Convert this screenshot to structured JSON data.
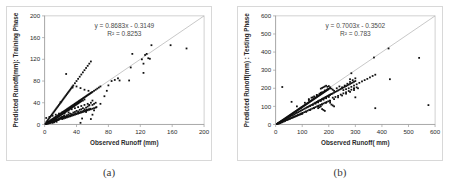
{
  "figure": {
    "background_color": "#ffffff",
    "panel_border_color": "#d8d8d8",
    "point_color": "#111111",
    "line_color": "#b0b0b0",
    "axis_color": "#9a9a9a"
  },
  "captions": {
    "a": "(a)",
    "b": "(b)"
  },
  "chart_data": [
    {
      "id": "a",
      "type": "scatter",
      "title": "",
      "xlabel": "Observed Runoff (mm)",
      "ylabel": "Predicted Runoff(mm): Training Phase",
      "xlim": [
        0,
        200
      ],
      "ylim": [
        0,
        200
      ],
      "xticks": [
        0,
        40,
        80,
        120,
        160,
        200
      ],
      "yticks": [
        0,
        40,
        80,
        120,
        160,
        200
      ],
      "grid": false,
      "legend": "none",
      "annotations": {
        "equation": "y = 0.8683x - 0.3149",
        "r2": "R² = 0.8253"
      },
      "fit": {
        "slope": 0.8683,
        "intercept": -0.3149,
        "r2": 0.8253
      },
      "reference_line": {
        "type": "1:1",
        "from": [
          0,
          0
        ],
        "to": [
          200,
          200
        ]
      },
      "x": [
        1,
        2,
        2,
        3,
        3,
        4,
        4,
        4,
        5,
        5,
        5,
        6,
        6,
        6,
        7,
        7,
        7,
        8,
        8,
        8,
        9,
        9,
        9,
        10,
        10,
        10,
        10,
        11,
        11,
        11,
        12,
        12,
        12,
        12,
        13,
        13,
        13,
        14,
        14,
        14,
        15,
        15,
        15,
        15,
        16,
        16,
        16,
        17,
        17,
        17,
        18,
        18,
        18,
        19,
        19,
        19,
        20,
        20,
        20,
        21,
        21,
        21,
        22,
        22,
        22,
        23,
        23,
        24,
        24,
        24,
        25,
        25,
        25,
        26,
        26,
        27,
        27,
        28,
        28,
        29,
        29,
        30,
        30,
        31,
        31,
        32,
        32,
        33,
        33,
        34,
        34,
        35,
        35,
        36,
        36,
        37,
        37,
        38,
        38,
        39,
        39,
        40,
        40,
        41,
        41,
        42,
        42,
        43,
        43,
        44,
        44,
        45,
        45,
        46,
        46,
        47,
        48,
        48,
        49,
        50,
        50,
        51,
        52,
        53,
        54,
        55,
        56,
        57,
        58,
        59,
        60,
        62,
        64,
        66,
        68,
        70,
        2,
        3,
        4,
        5,
        6,
        7,
        8,
        9,
        10,
        11,
        12,
        13,
        14,
        15,
        16,
        17,
        18,
        19,
        20,
        21,
        22,
        23,
        24,
        25,
        26,
        27,
        28,
        29,
        30,
        31,
        32,
        33,
        34,
        35,
        36,
        38,
        40,
        42,
        44,
        46,
        48,
        50,
        52,
        54,
        56,
        58,
        22,
        24,
        26,
        28,
        30,
        32,
        34,
        36,
        38,
        40,
        42,
        44,
        46,
        48,
        50,
        52,
        54,
        56,
        58,
        60,
        62,
        64,
        20,
        25,
        30,
        35,
        40,
        45,
        50,
        55,
        60,
        65,
        70,
        75,
        78,
        80,
        84,
        88,
        92,
        94,
        106,
        108,
        110,
        122,
        124,
        124,
        126,
        128,
        130,
        132,
        134,
        158,
        178,
        3,
        5,
        7,
        9,
        11,
        13,
        15,
        17,
        19,
        21,
        23,
        25,
        27,
        29,
        31,
        33,
        35,
        37,
        39,
        41,
        43,
        45,
        47,
        49,
        51,
        53,
        55,
        57,
        27,
        45,
        47,
        52,
        56,
        58,
        60,
        62,
        2,
        10,
        18,
        26,
        34,
        42,
        50,
        4,
        12,
        20,
        28,
        36,
        44,
        52,
        60,
        6,
        14,
        22,
        30,
        38,
        46,
        54,
        62,
        8,
        16,
        24,
        32,
        40,
        48,
        56,
        64,
        2,
        6,
        10,
        14,
        18,
        22,
        26,
        30,
        34,
        38,
        42,
        46,
        50,
        54,
        58
      ],
      "y": [
        1,
        2,
        1,
        3,
        2,
        4,
        3,
        2,
        5,
        4,
        2,
        6,
        4,
        3,
        7,
        5,
        3,
        8,
        6,
        4,
        9,
        7,
        4,
        10,
        8,
        6,
        3,
        11,
        9,
        5,
        12,
        10,
        7,
        4,
        13,
        10,
        6,
        14,
        11,
        7,
        15,
        12,
        9,
        5,
        16,
        13,
        8,
        17,
        14,
        9,
        18,
        15,
        10,
        19,
        16,
        11,
        20,
        17,
        12,
        21,
        18,
        13,
        22,
        19,
        14,
        23,
        20,
        24,
        21,
        15,
        25,
        22,
        16,
        26,
        23,
        27,
        24,
        28,
        25,
        29,
        26,
        30,
        27,
        31,
        28,
        32,
        29,
        33,
        30,
        34,
        31,
        35,
        32,
        36,
        33,
        37,
        34,
        38,
        35,
        39,
        36,
        40,
        37,
        41,
        38,
        42,
        39,
        43,
        40,
        44,
        41,
        45,
        42,
        46,
        43,
        47,
        48,
        44,
        49,
        50,
        46,
        51,
        52,
        53,
        54,
        55,
        56,
        57,
        58,
        59,
        60,
        62,
        64,
        66,
        68,
        70,
        4,
        6,
        8,
        10,
        12,
        14,
        16,
        18,
        20,
        22,
        24,
        26,
        28,
        30,
        32,
        34,
        36,
        38,
        40,
        42,
        44,
        46,
        48,
        50,
        52,
        54,
        56,
        58,
        60,
        62,
        64,
        66,
        68,
        70,
        72,
        76,
        80,
        84,
        88,
        92,
        96,
        100,
        104,
        108,
        112,
        116,
        10,
        11,
        12,
        13,
        14,
        15,
        16,
        17,
        18,
        19,
        20,
        21,
        22,
        23,
        24,
        25,
        26,
        27,
        28,
        29,
        30,
        31,
        41,
        20,
        22,
        68,
        70,
        67,
        64,
        62,
        44,
        32,
        38,
        52,
        62,
        72,
        80,
        82,
        85,
        81,
        81,
        105,
        130,
        120,
        95,
        112,
        128,
        130,
        122,
        121,
        146,
        146,
        140,
        2,
        3,
        4,
        5,
        6,
        7,
        8,
        9,
        10,
        11,
        12,
        13,
        14,
        15,
        16,
        17,
        18,
        19,
        20,
        21,
        22,
        23,
        24,
        25,
        26,
        27,
        28,
        29,
        93,
        3,
        11,
        23,
        36,
        10,
        18,
        26,
        1,
        5,
        9,
        14,
        19,
        24,
        28,
        2,
        7,
        12,
        17,
        22,
        27,
        31,
        36,
        3,
        8,
        13,
        18,
        23,
        28,
        33,
        38,
        4,
        9,
        15,
        20,
        25,
        30,
        35,
        40,
        12,
        14,
        16,
        18,
        20,
        22,
        24,
        26,
        28,
        30,
        32,
        34,
        36,
        38,
        40
      ]
    },
    {
      "id": "b",
      "type": "scatter",
      "title": "",
      "xlabel": "Observed Runoff( mm)",
      "ylabel": "Predicted Runoff(mm) : Testing Phase",
      "xlim": [
        0,
        600
      ],
      "ylim": [
        0,
        600
      ],
      "xticks": [
        0,
        100,
        200,
        300,
        400,
        500,
        600
      ],
      "yticks": [
        0,
        100,
        200,
        300,
        400,
        500,
        600
      ],
      "grid": false,
      "legend": "none",
      "annotations": {
        "equation": "y = 0.7003x - 0.3502",
        "r2": "R² = 0.783"
      },
      "fit": {
        "slope": 0.7003,
        "intercept": -0.3502,
        "r2": 0.783
      },
      "reference_line": {
        "type": "1:1",
        "from": [
          0,
          0
        ],
        "to": [
          600,
          600
        ]
      },
      "x": [
        5,
        8,
        10,
        12,
        14,
        16,
        18,
        20,
        22,
        24,
        26,
        28,
        30,
        32,
        34,
        36,
        38,
        40,
        42,
        44,
        46,
        48,
        50,
        52,
        54,
        56,
        58,
        60,
        62,
        64,
        66,
        68,
        70,
        72,
        74,
        76,
        78,
        80,
        82,
        84,
        86,
        88,
        90,
        92,
        94,
        96,
        98,
        100,
        102,
        104,
        106,
        108,
        110,
        112,
        114,
        116,
        118,
        120,
        122,
        124,
        126,
        128,
        130,
        132,
        134,
        136,
        138,
        140,
        142,
        144,
        146,
        148,
        150,
        152,
        154,
        156,
        158,
        160,
        162,
        164,
        166,
        168,
        170,
        172,
        174,
        176,
        178,
        180,
        182,
        184,
        186,
        188,
        190,
        192,
        194,
        196,
        198,
        200,
        10,
        15,
        20,
        25,
        30,
        35,
        40,
        45,
        50,
        55,
        60,
        65,
        70,
        75,
        80,
        85,
        90,
        95,
        100,
        105,
        110,
        115,
        120,
        125,
        130,
        135,
        140,
        145,
        150,
        155,
        160,
        165,
        170,
        175,
        180,
        185,
        190,
        195,
        200,
        205,
        210,
        12,
        18,
        24,
        30,
        36,
        42,
        48,
        54,
        60,
        66,
        72,
        78,
        84,
        90,
        96,
        102,
        108,
        114,
        120,
        126,
        132,
        138,
        144,
        150,
        156,
        162,
        168,
        174,
        180,
        186,
        192,
        198,
        204,
        120,
        130,
        140,
        150,
        160,
        170,
        180,
        190,
        200,
        125,
        135,
        145,
        155,
        165,
        175,
        185,
        195,
        205,
        150,
        155,
        160,
        165,
        170,
        175,
        180,
        185,
        190,
        195,
        200,
        205,
        210,
        215,
        220,
        225,
        230,
        235,
        240,
        245,
        250,
        255,
        260,
        265,
        270,
        275,
        280,
        285,
        290,
        295,
        300,
        25,
        60,
        80,
        95,
        110,
        125,
        140,
        155,
        170,
        185,
        100,
        115,
        130,
        145,
        160,
        175,
        190,
        205,
        220,
        235,
        250,
        265,
        280,
        295,
        310,
        170,
        175,
        180,
        185,
        190,
        195,
        200,
        205,
        210,
        215,
        220,
        230,
        240,
        250,
        260,
        270,
        280,
        290,
        300,
        215,
        225,
        235,
        245,
        255,
        265,
        275,
        285,
        295,
        305,
        255,
        265,
        275,
        285,
        295,
        305,
        315,
        325,
        335,
        345,
        355,
        365,
        375,
        425,
        540,
        575,
        370,
        375,
        430,
        280,
        285,
        295,
        300,
        205,
        210,
        215,
        220,
        160,
        165,
        170,
        175,
        180,
        185,
        5,
        10,
        15,
        20,
        25,
        30,
        35,
        40,
        45,
        50,
        55,
        60,
        65,
        70,
        75,
        80,
        85,
        90,
        95,
        100
      ],
      "y": [
        3,
        5,
        7,
        9,
        11,
        13,
        15,
        17,
        19,
        21,
        23,
        25,
        27,
        29,
        31,
        33,
        35,
        37,
        39,
        41,
        43,
        45,
        47,
        49,
        51,
        53,
        55,
        57,
        59,
        61,
        63,
        65,
        67,
        69,
        71,
        73,
        75,
        77,
        79,
        81,
        83,
        85,
        87,
        89,
        91,
        93,
        95,
        97,
        99,
        101,
        103,
        105,
        107,
        109,
        111,
        113,
        115,
        117,
        119,
        121,
        123,
        125,
        127,
        129,
        131,
        133,
        135,
        137,
        139,
        141,
        143,
        145,
        147,
        149,
        151,
        153,
        155,
        157,
        159,
        161,
        163,
        165,
        167,
        169,
        171,
        173,
        175,
        177,
        179,
        181,
        183,
        185,
        187,
        189,
        191,
        193,
        195,
        197,
        8,
        12,
        16,
        20,
        24,
        28,
        32,
        36,
        40,
        44,
        48,
        52,
        56,
        60,
        64,
        68,
        72,
        76,
        80,
        84,
        88,
        92,
        96,
        100,
        104,
        108,
        112,
        116,
        120,
        124,
        128,
        132,
        136,
        140,
        144,
        148,
        152,
        156,
        160,
        164,
        168,
        5,
        8,
        12,
        16,
        20,
        24,
        28,
        32,
        36,
        40,
        44,
        48,
        52,
        56,
        60,
        64,
        68,
        72,
        76,
        80,
        84,
        88,
        92,
        96,
        100,
        104,
        108,
        112,
        116,
        120,
        124,
        128,
        132,
        95,
        102,
        108,
        115,
        122,
        130,
        137,
        145,
        152,
        140,
        148,
        155,
        163,
        170,
        178,
        185,
        193,
        200,
        120,
        124,
        128,
        132,
        136,
        140,
        144,
        148,
        152,
        156,
        160,
        164,
        168,
        172,
        176,
        180,
        184,
        188,
        192,
        196,
        200,
        204,
        208,
        212,
        216,
        220,
        224,
        228,
        232,
        236,
        240,
        207,
        125,
        100,
        92,
        120,
        135,
        150,
        162,
        175,
        188,
        60,
        70,
        80,
        90,
        100,
        110,
        120,
        130,
        140,
        150,
        160,
        170,
        180,
        190,
        200,
        198,
        202,
        206,
        210,
        214,
        208,
        212,
        205,
        198,
        192,
        186,
        200,
        210,
        205,
        215,
        225,
        235,
        245,
        255,
        148,
        152,
        158,
        165,
        172,
        178,
        185,
        192,
        198,
        205,
        190,
        195,
        200,
        208,
        215,
        222,
        230,
        238,
        245,
        252,
        260,
        268,
        275,
        420,
        368,
        107,
        370,
        90,
        250,
        250,
        283,
        200,
        150,
        120,
        110,
        105,
        100,
        90,
        95,
        100,
        85,
        80,
        75,
        3,
        6,
        9,
        12,
        15,
        18,
        21,
        24,
        27,
        30,
        33,
        36,
        39,
        42,
        45,
        48,
        51,
        54,
        57,
        60
      ]
    }
  ]
}
